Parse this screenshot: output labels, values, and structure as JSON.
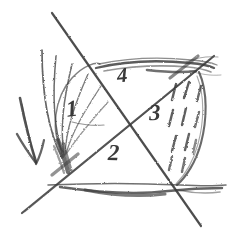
{
  "figure": {
    "medium": "pencil sketch",
    "background_color": "#ffffff",
    "ink_color": "#3a3a3a",
    "ink_color_dark": "#262626",
    "width": 230,
    "height": 237
  },
  "region_labels": [
    {
      "id": "label-1",
      "text": "1",
      "x": 74,
      "y": 108,
      "size": 22,
      "rotate": -6
    },
    {
      "id": "label-2",
      "text": "2",
      "x": 115,
      "y": 152,
      "size": 22,
      "rotate": 0
    },
    {
      "id": "label-3",
      "text": "3",
      "x": 156,
      "y": 112,
      "size": 22,
      "rotate": 0
    },
    {
      "id": "label-4",
      "text": "4",
      "x": 124,
      "y": 75,
      "size": 20,
      "rotate": -4
    }
  ],
  "annotations": {
    "arrow": {
      "name": "direction-arrow",
      "label": "downward arrow",
      "direction": "down",
      "from_x": 20,
      "from_y": 98,
      "to_x": 36,
      "to_y": 162
    },
    "fan_strokes": {
      "name": "left-fan-hatching",
      "label": "fan of curved strokes",
      "count": 6
    },
    "dash_hatching": {
      "name": "right-dash-hatching",
      "label": "short dash hatching",
      "count": 11
    }
  },
  "strokes": {
    "top_line": {
      "name": "top-horizontal-line",
      "x1": 95,
      "y1": 66,
      "x2": 216,
      "y2": 64
    },
    "bottom_line": {
      "name": "bottom-horizontal-line",
      "x1": 47,
      "y1": 185,
      "x2": 226,
      "y2": 186
    },
    "diagonal_down": {
      "name": "diagonal-down-right",
      "x1": 52,
      "y1": 13,
      "x2": 201,
      "y2": 226
    },
    "diagonal_up": {
      "name": "diagonal-up-right",
      "x1": 22,
      "y1": 213,
      "x2": 214,
      "y2": 56
    },
    "oval": {
      "name": "oval-outline",
      "cx": 120,
      "cy": 126,
      "rx": 82,
      "ry": 62
    }
  }
}
